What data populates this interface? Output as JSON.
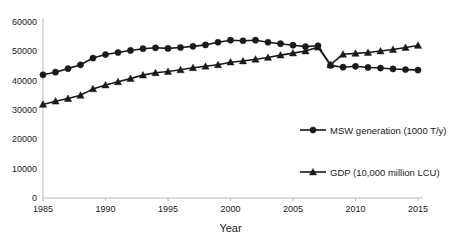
{
  "chart_data": {
    "type": "line",
    "title": "",
    "xlabel": "Year",
    "ylabel": "",
    "xlim": [
      1985,
      2015
    ],
    "ylim": [
      0,
      60000
    ],
    "grid": false,
    "legend_position": "inside-bottom-right",
    "xticks": [
      "1985",
      "1990",
      "1995",
      "2000",
      "2005",
      "2010",
      "2015"
    ],
    "yticks": [
      "0",
      "10000",
      "20000",
      "30000",
      "40000",
      "50000",
      "60000"
    ],
    "x": [
      1985,
      1986,
      1987,
      1988,
      1989,
      1990,
      1991,
      1992,
      1993,
      1994,
      1995,
      1996,
      1997,
      1998,
      1999,
      2000,
      2001,
      2002,
      2003,
      2004,
      2005,
      2006,
      2007,
      2008,
      2009,
      2010,
      2011,
      2012,
      2013,
      2014,
      2015
    ],
    "series": [
      {
        "name": "MSW generation (1000 T/y)",
        "marker": "circle",
        "values": [
          42000,
          42900,
          44100,
          45400,
          47700,
          48900,
          49600,
          50300,
          50900,
          51200,
          51000,
          51300,
          51700,
          52200,
          53100,
          53800,
          53600,
          53800,
          53100,
          52600,
          52100,
          51600,
          51900,
          45200,
          44600,
          44900,
          44500,
          44300,
          44000,
          43800,
          43600
        ]
      },
      {
        "name": "GDP (10,000 million LCU)",
        "marker": "triangle",
        "values": [
          31900,
          33000,
          33900,
          35000,
          37200,
          38500,
          39600,
          40700,
          41900,
          42700,
          43100,
          43700,
          44400,
          44900,
          45400,
          46300,
          46700,
          47300,
          47900,
          48700,
          49400,
          50100,
          51400,
          45500,
          49000,
          49300,
          49600,
          50100,
          50600,
          51300,
          52000
        ]
      }
    ]
  },
  "legend": {
    "items": [
      {
        "label": "MSW generation (1000 T/y)",
        "marker": "circle"
      },
      {
        "label": "GDP (10,000 million LCU)",
        "marker": "triangle"
      }
    ]
  },
  "colors": {
    "series": "#1a1a1a",
    "axis": "#b9b9b9",
    "background": "#ffffff"
  }
}
